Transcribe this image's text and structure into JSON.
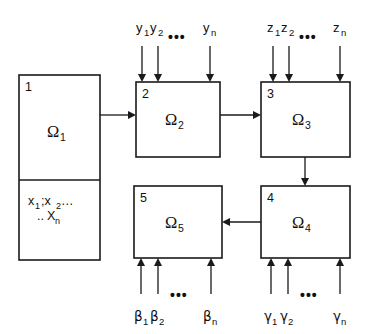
{
  "diagram": {
    "type": "block-flow-diagram",
    "background_color": "#ffffff",
    "line_color": "#1a1a1a",
    "boxes": [
      {
        "id": "box-1",
        "index": "1",
        "label": "Ω",
        "subscript": "1",
        "content_line1": "x",
        "content_sub1": "1",
        "content_sep": ";x",
        "content_sub2": "2",
        "content_dots": "…",
        "content_line2_dots": "..",
        "content_line2": "X",
        "content_line2_sub": "n",
        "has_divider": true,
        "x": 19,
        "y": 75,
        "w": 81,
        "h": 185,
        "divider_y": 180
      },
      {
        "id": "box-2",
        "index": "2",
        "label": "Ω",
        "subscript": "2",
        "has_divider": false,
        "x": 136,
        "y": 82,
        "w": 84,
        "h": 75
      },
      {
        "id": "box-3",
        "index": "3",
        "label": "Ω",
        "subscript": "3",
        "has_divider": false,
        "x": 261,
        "y": 82,
        "w": 89,
        "h": 75
      },
      {
        "id": "box-4",
        "index": "4",
        "label": "Ω",
        "subscript": "4",
        "has_divider": false,
        "x": 261,
        "y": 186,
        "w": 89,
        "h": 72
      },
      {
        "id": "box-5",
        "index": "5",
        "label": "Ω",
        "subscript": "5",
        "has_divider": false,
        "x": 134,
        "y": 186,
        "w": 88,
        "h": 72
      }
    ],
    "connectors": [
      {
        "id": "conn-1-2",
        "from": "box-1",
        "to": "box-2",
        "direction": "right"
      },
      {
        "id": "conn-2-3",
        "from": "box-2",
        "to": "box-3",
        "direction": "right"
      },
      {
        "id": "conn-3-4",
        "from": "box-3",
        "to": "box-4",
        "direction": "down"
      },
      {
        "id": "conn-4-5",
        "from": "box-4",
        "to": "box-5",
        "direction": "left"
      }
    ],
    "input_groups": [
      {
        "id": "inputs-y",
        "target": "box-2",
        "side": "top",
        "symbol": "y",
        "labels": [
          "y",
          "y",
          "y"
        ],
        "subscripts": [
          "1",
          "2",
          "n"
        ],
        "ellipsis": "•••"
      },
      {
        "id": "inputs-z",
        "target": "box-3",
        "side": "top",
        "symbol": "z",
        "labels": [
          "z",
          "z",
          "z"
        ],
        "subscripts": [
          "1",
          "2",
          "n"
        ],
        "ellipsis": "•••"
      },
      {
        "id": "inputs-beta",
        "target": "box-5",
        "side": "bottom",
        "symbol": "β",
        "labels": [
          "β",
          "β",
          "β"
        ],
        "subscripts": [
          "1",
          "2",
          "n"
        ],
        "ellipsis": "•••"
      },
      {
        "id": "inputs-gamma",
        "target": "box-4",
        "side": "bottom",
        "symbol": "γ",
        "labels": [
          "γ",
          "γ",
          "γ"
        ],
        "subscripts": [
          "1",
          "2",
          "n"
        ],
        "ellipsis": "•••"
      }
    ]
  }
}
